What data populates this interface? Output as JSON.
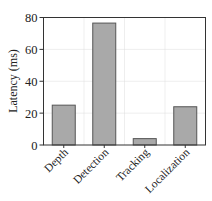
{
  "chart_data": {
    "type": "bar",
    "title": "",
    "xlabel": "",
    "ylabel": "Latency (ms)",
    "categories": [
      "Depth",
      "Detection",
      "Tracking",
      "Localization"
    ],
    "values": [
      25,
      76.5,
      4,
      24
    ],
    "ylim": [
      0,
      80
    ],
    "yticks": [
      0,
      20,
      40,
      60,
      80
    ],
    "ytick_labels": [
      "0",
      "20",
      "40",
      "60",
      "80"
    ],
    "grid": true,
    "legend": null,
    "colors": {
      "bar_fill": "#a9a9a9",
      "bar_edge": "#555555",
      "axis": "#333333",
      "grid": "#dddddd"
    }
  }
}
